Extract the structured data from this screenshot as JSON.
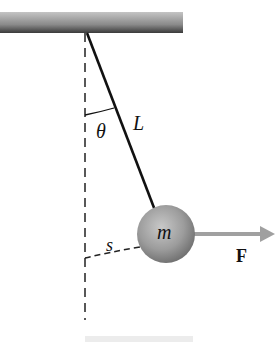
{
  "diagram": {
    "type": "pendulum-with-horizontal-force",
    "labels": {
      "angle": "θ",
      "length": "L",
      "mass": "m",
      "arc": "s",
      "force": "F"
    },
    "colors": {
      "ceiling_dark": "#3a3a3a",
      "ceiling_light": "#b8b8b8",
      "rod": "#111111",
      "ball": "#9a9a9a",
      "arrow": "#a0a0a0",
      "dashed": "#222222"
    }
  }
}
